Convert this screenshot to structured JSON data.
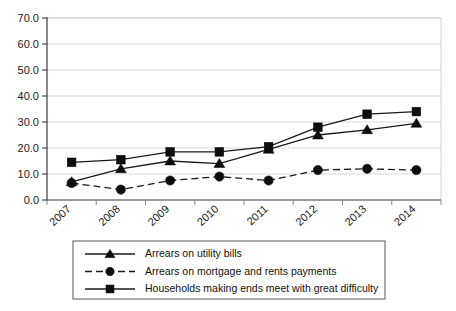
{
  "chart_data": {
    "type": "line",
    "title": "",
    "subtitle": "",
    "xlabel": "",
    "ylabel": "",
    "categories": [
      "2007",
      "2008",
      "2009",
      "2010",
      "2011",
      "2012",
      "2013",
      "2014"
    ],
    "x": [
      2007,
      2008,
      2009,
      2010,
      2011,
      2012,
      2013,
      2014
    ],
    "ylim": [
      0.0,
      70.0
    ],
    "ytick_values": [
      0.0,
      10.0,
      20.0,
      30.0,
      40.0,
      50.0,
      60.0,
      70.0
    ],
    "ytick_labels": [
      "0.0",
      "10.0",
      "20.0",
      "30.0",
      "40.0",
      "50.0",
      "60.0",
      "70.0"
    ],
    "grid": true,
    "grid_axis": "y",
    "legend_position": "bottom",
    "series": [
      {
        "name": "Arrears on utility bills",
        "marker": "triangle",
        "line_style": "solid",
        "color": "#0d0d0d",
        "values": [
          7.0,
          12.0,
          15.0,
          14.0,
          19.5,
          25.0,
          27.0,
          29.5
        ]
      },
      {
        "name": "Arrears on mortgage and rents payments",
        "marker": "circle",
        "line_style": "dashed",
        "color": "#0d0d0d",
        "values": [
          6.5,
          4.0,
          7.5,
          9.0,
          7.5,
          11.5,
          12.0,
          11.5
        ]
      },
      {
        "name": "Households making ends meet with great difficulty",
        "marker": "square",
        "line_style": "solid",
        "color": "#0d0d0d",
        "values": [
          14.5,
          15.5,
          18.5,
          18.5,
          20.5,
          28.0,
          33.0,
          34.0
        ]
      }
    ]
  },
  "legend": {
    "items": [
      {
        "label": "Arrears on utility bills",
        "marker": "triangle",
        "line_style": "solid"
      },
      {
        "label": "Arrears on mortgage and rents payments",
        "marker": "circle",
        "line_style": "dashed"
      },
      {
        "label": "Households making ends meet with great difficulty",
        "marker": "square",
        "line_style": "solid"
      }
    ]
  },
  "colors": {
    "background": "#ffffff",
    "gridline": "#d9d9d9",
    "axis": "#3a3a3a",
    "frame": "#d0d0d0",
    "ink": "#0d0d0d"
  }
}
